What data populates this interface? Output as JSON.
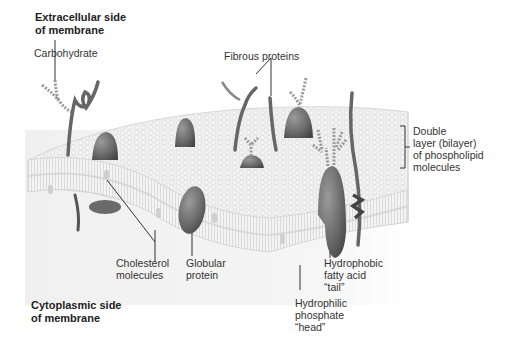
{
  "figure": {
    "type": "cell membrane cross-section diagram",
    "side_labels": {
      "extracellular": [
        "Extracellular side",
        "of membrane"
      ],
      "cytoplasmic": [
        "Cytoplasmic side",
        "of membrane"
      ]
    },
    "labels": {
      "carbohydrate": [
        "Carbohydrate"
      ],
      "fibrous_proteins": [
        "Fibrous proteins"
      ],
      "bilayer": [
        "Double",
        "layer (bilayer)",
        "of phospholipid",
        "molecules"
      ],
      "cholesterol": [
        "Cholesterol",
        "molecules"
      ],
      "globular_protein": [
        "Globular",
        "protein"
      ],
      "hydrophobic_tail": [
        "Hydrophobic",
        "fatty acid",
        "“tail”"
      ],
      "hydrophilic_head": [
        "Hydrophilic",
        "phosphate",
        "“head”"
      ]
    },
    "colors": {
      "protein": "#6e6e6e",
      "protein_dark": "#4a4a4a",
      "membrane_surface": "#eeeeee",
      "membrane_edge": "#d9d9d9",
      "background_fade": "#f4f4f4",
      "leader_line": "#333333"
    }
  }
}
